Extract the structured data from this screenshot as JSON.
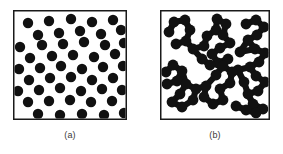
{
  "figure": {
    "background_color": "#ffffff",
    "particle_color": "#111111",
    "frame_color": "#1a1a1a",
    "panels": [
      {
        "id": "a",
        "caption": "(a)",
        "state": "dispersed",
        "frame": {
          "x": 0,
          "y": 0,
          "width": 114,
          "height": 110
        },
        "particle_radius": 5.2,
        "particle_count": 46,
        "particles": [
          [
            12,
            9
          ],
          [
            33,
            7
          ],
          [
            55,
            5
          ],
          [
            76,
            8
          ],
          [
            97,
            6
          ],
          [
            22,
            21
          ],
          [
            43,
            19
          ],
          [
            64,
            17
          ],
          [
            85,
            20
          ],
          [
            105,
            16
          ],
          [
            4,
            33
          ],
          [
            26,
            31
          ],
          [
            47,
            30
          ],
          [
            68,
            28
          ],
          [
            89,
            31
          ],
          [
            108,
            29
          ],
          [
            14,
            44
          ],
          [
            36,
            42
          ],
          [
            57,
            41
          ],
          [
            78,
            43
          ],
          [
            99,
            40
          ],
          [
            3,
            55
          ],
          [
            24,
            54
          ],
          [
            45,
            52
          ],
          [
            66,
            55
          ],
          [
            87,
            53
          ],
          [
            107,
            52
          ],
          [
            13,
            66
          ],
          [
            34,
            64
          ],
          [
            55,
            63
          ],
          [
            76,
            66
          ],
          [
            97,
            64
          ],
          [
            2,
            77
          ],
          [
            23,
            76
          ],
          [
            44,
            74
          ],
          [
            65,
            77
          ],
          [
            86,
            75
          ],
          [
            106,
            76
          ],
          [
            12,
            88
          ],
          [
            33,
            87
          ],
          [
            54,
            86
          ],
          [
            75,
            88
          ],
          [
            96,
            87
          ],
          [
            22,
            100
          ],
          [
            44,
            101
          ],
          [
            66,
            100
          ],
          [
            88,
            101
          ],
          [
            108,
            99
          ]
        ]
      },
      {
        "id": "b",
        "caption": "(b)",
        "state": "aggregated",
        "frame": {
          "x": 0,
          "y": 0,
          "width": 110,
          "height": 110
        },
        "particle_radius": 5.4,
        "bond_width": 6.2,
        "cluster_count": 4,
        "clusters": [
          {
            "name": "upper-left-chain",
            "nodes": [
              [
                9,
                22
              ],
              [
                14,
                12
              ],
              [
                25,
                10
              ],
              [
                30,
                20
              ],
              [
                26,
                31
              ],
              [
                16,
                34
              ],
              [
                33,
                39
              ],
              [
                44,
                36
              ],
              [
                47,
                26
              ],
              [
                56,
                20
              ],
              [
                57,
                9
              ],
              [
                66,
                14
              ],
              [
                63,
                25
              ],
              [
                70,
                33
              ],
              [
                60,
                38
              ],
              [
                52,
                44
              ],
              [
                58,
                53
              ],
              [
                68,
                49
              ],
              [
                50,
                55
              ],
              [
                42,
                49
              ]
            ],
            "bonds": [
              [
                0,
                1
              ],
              [
                1,
                2
              ],
              [
                2,
                3
              ],
              [
                3,
                4
              ],
              [
                4,
                5
              ],
              [
                4,
                6
              ],
              [
                6,
                7
              ],
              [
                7,
                8
              ],
              [
                8,
                9
              ],
              [
                9,
                10
              ],
              [
                10,
                11
              ],
              [
                11,
                12
              ],
              [
                12,
                13
              ],
              [
                13,
                14
              ],
              [
                14,
                15
              ],
              [
                15,
                16
              ],
              [
                16,
                17
              ],
              [
                16,
                18
              ],
              [
                18,
                19
              ],
              [
                6,
                19
              ],
              [
                9,
                12
              ]
            ]
          },
          {
            "name": "right-chain",
            "nodes": [
              [
                86,
                14
              ],
              [
                96,
                10
              ],
              [
                104,
                17
              ],
              [
                97,
                25
              ],
              [
                88,
                30
              ],
              [
                95,
                39
              ],
              [
                105,
                43
              ],
              [
                99,
                52
              ],
              [
                90,
                57
              ],
              [
                96,
                66
              ],
              [
                105,
                72
              ],
              [
                98,
                81
              ],
              [
                88,
                84
              ],
              [
                93,
                94
              ],
              [
                103,
                99
              ],
              [
                80,
                42
              ],
              [
                78,
                60
              ],
              [
                84,
                72
              ]
            ],
            "bonds": [
              [
                0,
                1
              ],
              [
                1,
                2
              ],
              [
                2,
                3
              ],
              [
                3,
                4
              ],
              [
                4,
                5
              ],
              [
                5,
                6
              ],
              [
                6,
                7
              ],
              [
                7,
                8
              ],
              [
                8,
                9
              ],
              [
                9,
                10
              ],
              [
                10,
                11
              ],
              [
                11,
                12
              ],
              [
                12,
                13
              ],
              [
                13,
                14
              ],
              [
                4,
                15
              ],
              [
                15,
                5
              ],
              [
                8,
                16
              ],
              [
                16,
                17
              ],
              [
                17,
                12
              ]
            ]
          },
          {
            "name": "lower-left-chain",
            "nodes": [
              [
                6,
                62
              ],
              [
                13,
                55
              ],
              [
                22,
                61
              ],
              [
                17,
                71
              ],
              [
                7,
                74
              ],
              [
                26,
                74
              ],
              [
                20,
                84
              ],
              [
                12,
                92
              ],
              [
                22,
                97
              ],
              [
                33,
                90
              ],
              [
                36,
                79
              ],
              [
                46,
                76
              ],
              [
                44,
                87
              ],
              [
                53,
                94
              ],
              [
                63,
                90
              ],
              [
                60,
                79
              ],
              [
                70,
                73
              ],
              [
                72,
                62
              ],
              [
                63,
                56
              ],
              [
                56,
                65
              ]
            ],
            "bonds": [
              [
                0,
                1
              ],
              [
                1,
                2
              ],
              [
                2,
                3
              ],
              [
                3,
                4
              ],
              [
                2,
                5
              ],
              [
                5,
                6
              ],
              [
                6,
                7
              ],
              [
                7,
                8
              ],
              [
                8,
                9
              ],
              [
                9,
                10
              ],
              [
                10,
                5
              ],
              [
                10,
                11
              ],
              [
                11,
                12
              ],
              [
                12,
                13
              ],
              [
                13,
                14
              ],
              [
                14,
                15
              ],
              [
                15,
                16
              ],
              [
                16,
                17
              ],
              [
                17,
                18
              ],
              [
                18,
                19
              ],
              [
                19,
                11
              ]
            ]
          },
          {
            "name": "lower-right-chain",
            "nodes": [
              [
                76,
                96
              ],
              [
                86,
                100
              ],
              [
                96,
                103
              ]
            ],
            "bonds": [
              [
                0,
                1
              ],
              [
                1,
                2
              ]
            ]
          }
        ]
      }
    ]
  }
}
